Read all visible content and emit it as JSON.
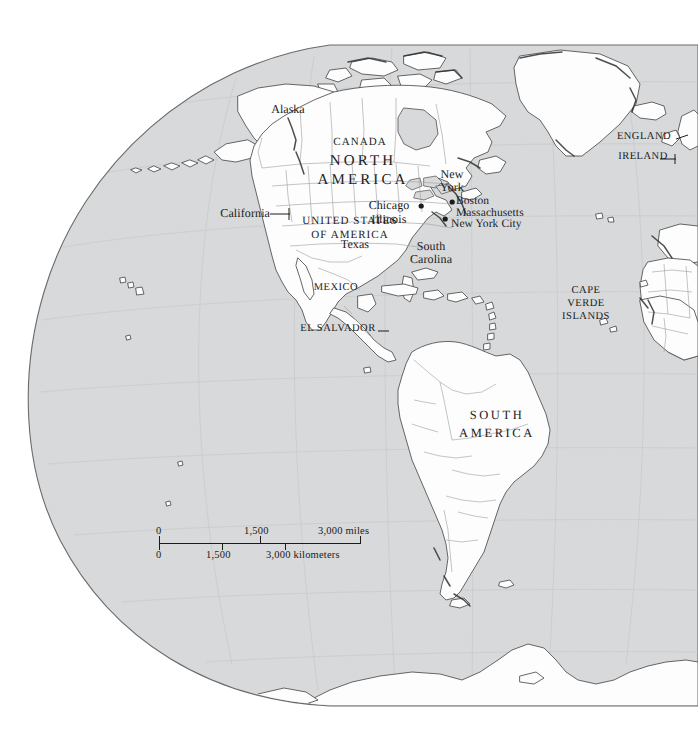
{
  "figure": {
    "kind": "world-globe-map",
    "projection_note": "orthographic globe showing the Americas and the eastern Atlantic",
    "colors": {
      "page_background": "#ffffff",
      "ocean_fill": "#d7d9da",
      "land_fill": "#fdfdfd",
      "coastline_stroke": "#4a4a4a",
      "border_stroke": "#9a9a9a",
      "graticule_stroke": "#c3c5c6",
      "globe_edge_stroke": "#6a6a6a",
      "label_text": "#1b1b1b"
    }
  },
  "labels": {
    "alaska": "Alaska",
    "canada": "CANADA",
    "north_america_line1": "NORTH",
    "north_america_line2": "AMERICA",
    "california": "California",
    "united_states_line1": "UNITED STATES",
    "united_states_line2": "OF AMERICA",
    "chicago": "Chicago",
    "illinois": "Illinois",
    "texas": "Texas",
    "new_york_line1": "New",
    "new_york_line2": "York",
    "boston": "Boston",
    "massachusetts": "Massachusetts",
    "new_york_city": "New York City",
    "south_carolina_line1": "South",
    "south_carolina_line2": "Carolina",
    "mexico": "MEXICO",
    "el_salvador": "EL SALVADOR",
    "south_america_line1": "SOUTH",
    "south_america_line2": "AMERICA",
    "england": "ENGLAND",
    "ireland": "IRELAND",
    "cape_verde_line1": "CAPE",
    "cape_verde_line2": "VERDE",
    "cape_verde_line3": "ISLANDS"
  },
  "scale_bar": {
    "miles": {
      "ticks": [
        "0",
        "1,500",
        "3,000"
      ],
      "unit_label": "miles",
      "end_text": "3,000 miles"
    },
    "kilometers": {
      "ticks": [
        "0",
        "1,500",
        "3,000"
      ],
      "unit_label": "kilometers",
      "mid_text": "3,000 kilometers"
    }
  }
}
